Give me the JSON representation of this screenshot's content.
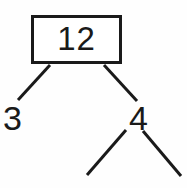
{
  "diagram": {
    "kind": "factor-tree",
    "title_text": "",
    "colors": {
      "background": "#fefefe",
      "stroke": "#1a1a1a",
      "box_fill": "#ffffff",
      "text": "#1a1a1a"
    },
    "root": {
      "value": "12",
      "boxed": true,
      "box": {
        "x": 31,
        "y": 15,
        "width": 91,
        "height": 49,
        "stroke_width": 3
      }
    },
    "children": [
      {
        "value": "3",
        "boxed": false,
        "position": {
          "x": 17,
          "y": 117
        }
      },
      {
        "value": "4",
        "boxed": false,
        "position": {
          "x": 140,
          "y": 117
        }
      }
    ],
    "edges": [
      {
        "name": "root-to-left",
        "x1": 50,
        "y1": 65,
        "x2": 18,
        "y2": 100,
        "stroke_width": 3
      },
      {
        "name": "root-to-right",
        "x1": 104,
        "y1": 65,
        "x2": 137,
        "y2": 101,
        "stroke_width": 3
      },
      {
        "name": "right-to-lower-left",
        "x1": 126,
        "y1": 130,
        "x2": 87,
        "y2": 175,
        "stroke_width": 3
      },
      {
        "name": "right-to-lower-right",
        "x1": 143,
        "y1": 131,
        "x2": 181,
        "y2": 176,
        "stroke_width": 3
      }
    ]
  }
}
